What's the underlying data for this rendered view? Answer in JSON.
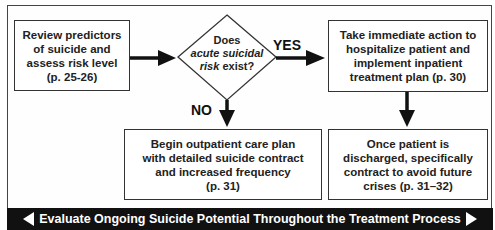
{
  "diagram": {
    "nodes": {
      "assess": {
        "lines": [
          "Review predictors",
          "of suicide and",
          "assess risk level",
          "(p. 25-26)"
        ]
      },
      "decision": {
        "line1": "Does",
        "line2_italic": "acute suicidal",
        "line3_italic": "risk",
        "line3_rest": " exist?"
      },
      "inpatient": {
        "lines": [
          "Take immediate action to",
          "hospitalize patient and",
          "implement inpatient",
          "treatment plan (p. 30)"
        ]
      },
      "outpatient": {
        "lines": [
          "Begin outpatient care plan",
          "with detailed suicide contract",
          "and increased frequency",
          "(p. 31)"
        ]
      },
      "discharge": {
        "lines": [
          "Once patient is",
          "discharged, specifically",
          "contract to avoid future",
          "crises (p. 31–32)"
        ]
      }
    },
    "edges": [
      {
        "from": "assess",
        "to": "decision",
        "label": ""
      },
      {
        "from": "decision",
        "to": "inpatient",
        "label": "YES"
      },
      {
        "from": "decision",
        "to": "outpatient",
        "label": "NO"
      },
      {
        "from": "inpatient",
        "to": "discharge",
        "label": ""
      }
    ],
    "labels": {
      "yes": "YES",
      "no": "NO"
    },
    "footer_bar": "Evaluate Ongoing Suicide Potential Throughout the Treatment Process"
  }
}
